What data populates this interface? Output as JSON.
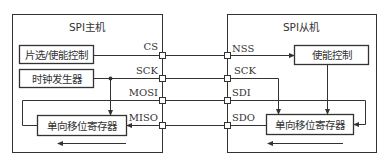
{
  "master": {
    "title": "SPI主机",
    "chip_select_block": "片选/使能控制",
    "clock_block": "时钟发生器",
    "shift_register": "单向移位寄存器",
    "pins": {
      "cs": "CS",
      "sck": "SCK",
      "mosi": "MOSI",
      "miso": "MISO"
    }
  },
  "slave": {
    "title": "SPI从机",
    "enable_block": "使能控制",
    "shift_register": "单向移位寄存器",
    "pins": {
      "nss": "NSS",
      "sck": "SCK",
      "sdi": "SDI",
      "sdo": "SDO"
    }
  },
  "colors": {
    "line": "#333333",
    "background": "#ffffff"
  }
}
